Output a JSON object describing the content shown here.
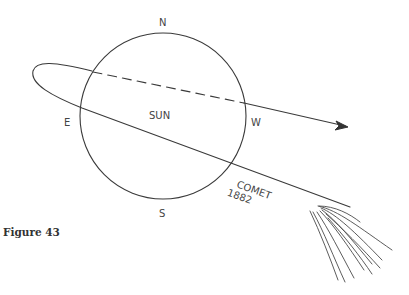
{
  "figure": {
    "caption": "Figure 43",
    "sun_label": "SUN",
    "compass": {
      "north": "N",
      "south": "S",
      "east": "E",
      "west": "W"
    },
    "comet_label_line1": "COMET",
    "comet_label_line2": "1882"
  },
  "colors": {
    "ink": "#3a3a3a",
    "background": "#ffffff"
  }
}
